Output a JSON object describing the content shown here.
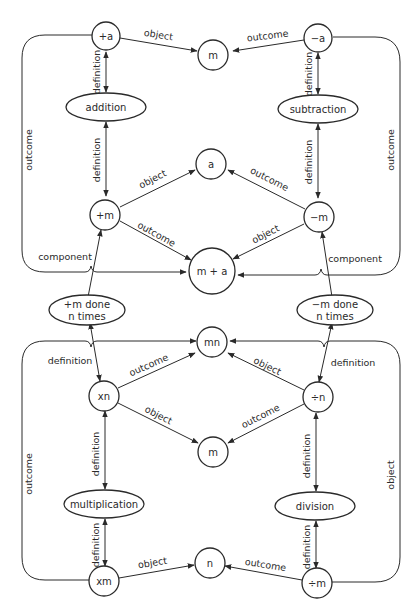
{
  "colors": {
    "ink": "#2a2a2a",
    "background": "#ffffff"
  },
  "nodes": {
    "plus_a": "+a",
    "m_top": "m",
    "minus_a": "−a",
    "addition": "addition",
    "subtraction": "subtraction",
    "a": "a",
    "plus_m": "+m",
    "minus_m": "−m",
    "m_plus_a": "m + a",
    "plus_m_done_line1": "+m done",
    "plus_m_done_line2": "n times",
    "minus_m_done_line1": "−m done",
    "minus_m_done_line2": "n times",
    "mn": "mn",
    "xn": "xn",
    "div_n": "÷n",
    "m_mid": "m",
    "multiplication": "multiplication",
    "division": "division",
    "xm": "xm",
    "n": "n",
    "div_m": "÷m"
  },
  "edges": {
    "plus_a_object": "object",
    "minus_a_outcome": "outcome",
    "plus_a_def": "definition",
    "minus_a_def": "definition",
    "addition_def": "definition",
    "subtraction_def": "definition",
    "plus_m_object": "object",
    "minus_m_outcome": "outcome",
    "plus_m_outcome": "outcome",
    "minus_m_object": "object",
    "left_outer_outcome": "outcome",
    "right_outer_outcome": "outcome",
    "left_component": "component",
    "right_component": "component",
    "left_definition_lower": "definition",
    "right_definition_lower": "definition",
    "xn_outcome": "outcome",
    "xn_object": "object",
    "div_n_object": "object",
    "div_n_outcome": "outcome",
    "multiplication_def": "definition",
    "division_def": "definition",
    "xm_def": "definition",
    "div_m_def": "definition",
    "xm_object": "object",
    "div_m_outcome": "outcome",
    "left_outer_outcome_lower": "outcome",
    "right_outer_object_lower": "object"
  }
}
